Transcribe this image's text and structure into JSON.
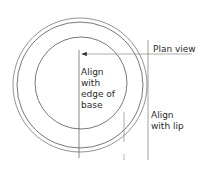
{
  "diagram": {
    "title": "Plan view",
    "labels": {
      "plan_view": "Plan view",
      "align_base": [
        "Align",
        "with",
        "edge of",
        "base"
      ],
      "align_lip": [
        "Align",
        "with lip"
      ]
    },
    "colors": {
      "stroke": "#555555",
      "stroke_light": "#8a8a8a",
      "text": "#2a2a2a",
      "background": "#ffffff"
    },
    "shapes": {
      "outer_rim_circle": {
        "cx": 80,
        "cy": 85,
        "r": 67
      },
      "inner_rim_circle": {
        "cx": 80,
        "cy": 85,
        "r": 63
      },
      "base_circle": {
        "cx": 81,
        "cy": 83,
        "r": 46
      },
      "base_guide_line": {
        "x": 79,
        "y1": 50,
        "y2": 158
      },
      "lip_guide_line": {
        "x": 148,
        "y1": 40,
        "y2": 160
      },
      "plan_leader_line": {
        "y": 54,
        "x1": 80,
        "x2": 192
      },
      "short_guide_line": {
        "x": 124,
        "y1": 112,
        "y2": 142
      },
      "short_tick": {
        "x": 124,
        "y1": 154,
        "y2": 160
      }
    }
  }
}
